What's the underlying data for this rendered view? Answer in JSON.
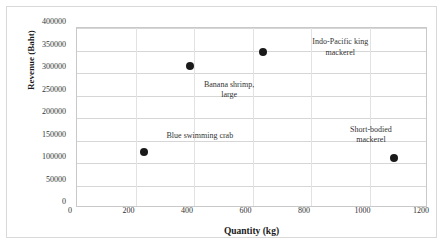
{
  "chart_data": {
    "type": "scatter",
    "title": "",
    "xlabel": "Quantity (kg)",
    "ylabel": "Revenue (Baht)",
    "xlim": [
      0,
      1200
    ],
    "ylim": [
      0,
      400000
    ],
    "xticks": [
      "0",
      "200",
      "400",
      "600",
      "800",
      "1000",
      "1200"
    ],
    "xtick_values": [
      0,
      200,
      400,
      600,
      800,
      1000,
      1200
    ],
    "yticks": [
      "0",
      "50000",
      "100000",
      "150000",
      "200000",
      "250000",
      "300000",
      "350000",
      "400000"
    ],
    "ytick_values": [
      0,
      50000,
      100000,
      150000,
      200000,
      250000,
      300000,
      350000,
      400000
    ],
    "grid": "horizontal-and-vertical",
    "legend": "none",
    "marker_color": "#1a1a1a",
    "points": [
      {
        "label": "Blue swimming crab",
        "x": 228,
        "y": 125000,
        "annotation_x": 420,
        "annotation_y": 160000
      },
      {
        "label": "Banana shrimp,\nlarge",
        "x": 386,
        "y": 316000,
        "annotation_x": 520,
        "annotation_y": 262000
      },
      {
        "label": "Indo-Pacific king\nmackerel",
        "x": 637,
        "y": 347000,
        "annotation_x": 900,
        "annotation_y": 357000
      },
      {
        "label": "Short-bodied\nmackerel",
        "x": 1085,
        "y": 112000,
        "annotation_x": 1005,
        "annotation_y": 162000
      }
    ]
  },
  "caption": {
    "text": "Figure 1. Top four争 species and their"
  }
}
